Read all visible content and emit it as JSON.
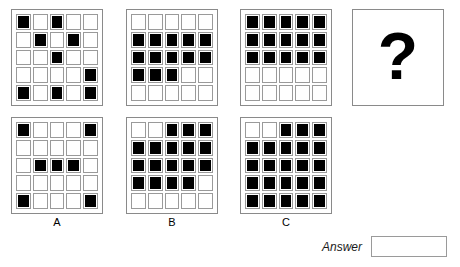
{
  "puzzle": {
    "type": "matrix-reasoning",
    "grid_size": [
      5,
      5
    ],
    "legend": {
      "filled": 1,
      "empty": 0
    },
    "question_mark": "?",
    "answer": {
      "label": "Answer",
      "value": "",
      "placeholder": ""
    },
    "sequence": [
      {
        "name": "panel-1",
        "cells": [
          [
            1,
            0,
            1,
            0,
            0
          ],
          [
            0,
            1,
            0,
            1,
            0
          ],
          [
            0,
            0,
            1,
            0,
            0
          ],
          [
            0,
            0,
            0,
            0,
            1
          ],
          [
            1,
            0,
            1,
            0,
            1
          ]
        ]
      },
      {
        "name": "panel-2",
        "cells": [
          [
            0,
            0,
            0,
            0,
            0
          ],
          [
            1,
            1,
            1,
            1,
            1
          ],
          [
            1,
            1,
            1,
            1,
            1
          ],
          [
            1,
            1,
            1,
            0,
            0
          ],
          [
            0,
            0,
            0,
            0,
            0
          ]
        ]
      },
      {
        "name": "panel-3",
        "cells": [
          [
            1,
            1,
            1,
            1,
            1
          ],
          [
            1,
            1,
            1,
            1,
            1
          ],
          [
            1,
            1,
            1,
            1,
            1
          ],
          [
            0,
            0,
            0,
            0,
            0
          ],
          [
            0,
            0,
            0,
            0,
            0
          ]
        ]
      }
    ],
    "options": [
      {
        "name": "panel-a",
        "label": "A",
        "cells": [
          [
            1,
            0,
            0,
            0,
            1
          ],
          [
            0,
            0,
            0,
            0,
            0
          ],
          [
            0,
            1,
            1,
            1,
            0
          ],
          [
            0,
            0,
            0,
            0,
            0
          ],
          [
            1,
            0,
            0,
            0,
            1
          ]
        ]
      },
      {
        "name": "panel-b",
        "label": "B",
        "cells": [
          [
            0,
            0,
            1,
            1,
            1
          ],
          [
            1,
            1,
            1,
            1,
            1
          ],
          [
            1,
            1,
            1,
            1,
            1
          ],
          [
            1,
            1,
            1,
            1,
            0
          ],
          [
            0,
            0,
            0,
            0,
            0
          ]
        ]
      },
      {
        "name": "panel-c",
        "label": "C",
        "cells": [
          [
            0,
            0,
            1,
            1,
            1
          ],
          [
            1,
            1,
            1,
            1,
            1
          ],
          [
            1,
            1,
            1,
            1,
            1
          ],
          [
            1,
            1,
            1,
            1,
            1
          ],
          [
            1,
            1,
            1,
            1,
            1
          ]
        ]
      }
    ]
  },
  "colors": {
    "filled": "#000000",
    "empty": "#ffffff",
    "cell_border": "#9a9a9a",
    "panel_border": "#8a8a8a",
    "text": "#000000"
  }
}
